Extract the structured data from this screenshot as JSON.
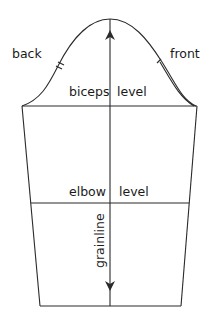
{
  "diagram": {
    "type": "sleeve pattern",
    "labels": {
      "back": "back",
      "front": "front",
      "biceps_left": "biceps",
      "biceps_right": "level",
      "elbow_left": "elbow",
      "elbow_right": "level",
      "grainline": "grainline"
    },
    "notches": {
      "back": "double notch",
      "front": "single notch"
    },
    "colors": {
      "line": "#2a2a2a",
      "text": "#1a1a1a",
      "background": "#ffffff"
    }
  }
}
